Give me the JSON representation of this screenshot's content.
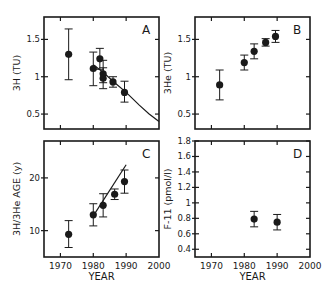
{
  "chart_data": [
    {
      "panel": "A",
      "type": "scatter",
      "title": "",
      "xlabel": "",
      "ylabel": "3H (TU)",
      "xlim": [
        1965,
        2000
      ],
      "ylim": [
        0.3,
        1.8
      ],
      "xticks": [
        1970,
        1980,
        1990,
        2000
      ],
      "xtick_labels_shown": false,
      "yticks": [
        0.5,
        1,
        1.5
      ],
      "ytick_labels": [
        "0.5",
        "1",
        "1.5"
      ],
      "points": [
        {
          "x": 1972.5,
          "y": 1.3,
          "err_lo": 0.96,
          "err_hi": 1.64
        },
        {
          "x": 1980,
          "y": 1.11,
          "err_lo": 0.88,
          "err_hi": 1.33
        },
        {
          "x": 1982,
          "y": 1.24,
          "err_lo": 1.1,
          "err_hi": 1.38
        },
        {
          "x": 1983,
          "y": 1.04,
          "err_lo": 0.92,
          "err_hi": 1.22
        },
        {
          "x": 1983,
          "y": 0.98,
          "err_lo": 0.84,
          "err_hi": 1.12
        },
        {
          "x": 1986,
          "y": 0.93,
          "err_lo": 0.86,
          "err_hi": 1.0
        },
        {
          "x": 1989.5,
          "y": 0.79,
          "err_lo": 0.66,
          "err_hi": 0.94
        }
      ],
      "curve": {
        "x": [
          1980,
          1983,
          1986,
          1990,
          1994,
          1997,
          2000
        ],
        "y": [
          1.16,
          1.06,
          0.94,
          0.79,
          0.62,
          0.5,
          0.4
        ]
      },
      "grid": false,
      "legend": null
    },
    {
      "panel": "B",
      "type": "scatter",
      "title": "",
      "xlabel": "",
      "ylabel": "3He (TU)",
      "xlim": [
        1965,
        2000
      ],
      "ylim": [
        0.3,
        1.8
      ],
      "xticks": [
        1970,
        1980,
        1990,
        2000
      ],
      "xtick_labels_shown": false,
      "yticks": [
        0.5,
        1,
        1.5
      ],
      "ytick_labels": [
        "0.5",
        "1",
        "1.5"
      ],
      "points": [
        {
          "x": 1972.5,
          "y": 0.89,
          "err_lo": 0.69,
          "err_hi": 1.09
        },
        {
          "x": 1980,
          "y": 1.19,
          "err_lo": 1.09,
          "err_hi": 1.29
        },
        {
          "x": 1983,
          "y": 1.34,
          "err_lo": 1.24,
          "err_hi": 1.44
        },
        {
          "x": 1986.5,
          "y": 1.46,
          "err_lo": 1.41,
          "err_hi": 1.51
        },
        {
          "x": 1989.5,
          "y": 1.54,
          "err_lo": 1.46,
          "err_hi": 1.62
        }
      ],
      "grid": false,
      "legend": null
    },
    {
      "panel": "C",
      "type": "scatter",
      "title": "",
      "xlabel": "YEAR",
      "ylabel": "3H/3He AGE (y)",
      "xlim": [
        1965,
        2000
      ],
      "ylim": [
        5,
        27
      ],
      "xticks": [
        1970,
        1980,
        1990,
        2000
      ],
      "xtick_labels": [
        "1970",
        "1980",
        "1990",
        "2000"
      ],
      "yticks": [
        10,
        20
      ],
      "ytick_labels": [
        "10",
        "20"
      ],
      "points": [
        {
          "x": 1972.5,
          "y": 9.3,
          "err_lo": 6.8,
          "err_hi": 11.9
        },
        {
          "x": 1980,
          "y": 13.0,
          "err_lo": 10.9,
          "err_hi": 15.1
        },
        {
          "x": 1983,
          "y": 14.8,
          "err_lo": 12.6,
          "err_hi": 17.0
        },
        {
          "x": 1986.5,
          "y": 16.9,
          "err_lo": 15.9,
          "err_hi": 17.9
        },
        {
          "x": 1989.5,
          "y": 19.3,
          "err_lo": 17.1,
          "err_hi": 21.5
        }
      ],
      "line": {
        "x": [
          1980,
          1990
        ],
        "y": [
          12.8,
          22.5
        ]
      },
      "grid": false,
      "legend": null
    },
    {
      "panel": "D",
      "type": "scatter",
      "title": "",
      "xlabel": "YEAR",
      "ylabel": "F-11 (pmol/l)",
      "xlim": [
        1965,
        2000
      ],
      "ylim": [
        0.3,
        1.8
      ],
      "xticks": [
        1970,
        1980,
        1990,
        2000
      ],
      "xtick_labels": [
        "1970",
        "1980",
        "1990",
        "2000"
      ],
      "yticks": [
        0.4,
        0.6,
        0.8,
        1,
        1.2,
        1.4,
        1.6,
        1.8
      ],
      "ytick_labels": [
        "0.4",
        "0.6",
        "0.8",
        "1",
        "1.2",
        "1.4",
        "1.6",
        "1.8"
      ],
      "points": [
        {
          "x": 1983,
          "y": 0.79,
          "err_lo": 0.69,
          "err_hi": 0.89
        },
        {
          "x": 1990,
          "y": 0.75,
          "err_lo": 0.65,
          "err_hi": 0.85
        }
      ],
      "grid": false,
      "legend": null
    }
  ],
  "panels": {
    "A": {
      "letter": "A",
      "ylabel_main": "3H (TU)"
    },
    "B": {
      "letter": "B",
      "ylabel_sup": "3",
      "ylabel_main": "He (TU)"
    },
    "C": {
      "letter": "C",
      "ylabel_main": "3H/3He AGE (y)",
      "xlabel": "YEAR"
    },
    "D": {
      "letter": "D",
      "ylabel_main": "F-11 (pmol/l)",
      "xlabel": "YEAR"
    }
  }
}
